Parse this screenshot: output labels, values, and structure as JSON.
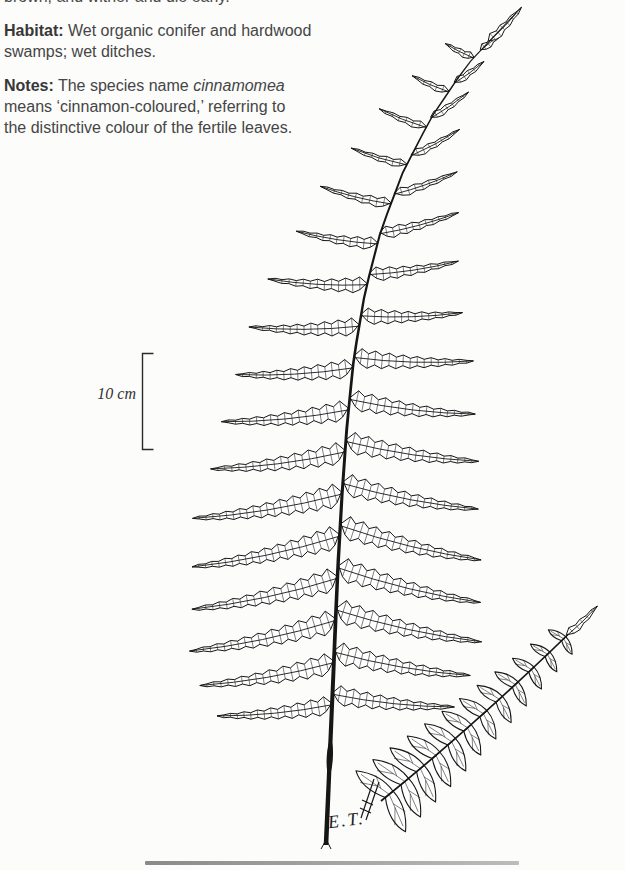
{
  "page": {
    "background": "#fcfcfb"
  },
  "top_text": {
    "clipped_line": "brown, and wither and die early.",
    "habitat": {
      "label": "Habitat:",
      "line1_rest": " Wet organic conifer and hardwood",
      "line2": "swamps; wet ditches."
    },
    "notes": {
      "label": "Notes:",
      "line1_pre": " The species name ",
      "line1_italic": "cinnamomea",
      "line2": "means ‘cinnamon-coloured,’ referring to",
      "line3": "the distinctive colour of the fertile leaves."
    }
  },
  "illustration": {
    "scale_label": "10 cm",
    "signature": "E.T.",
    "ink_color": "#161616"
  },
  "footer": {
    "bar_color_left": "#8a8a8a",
    "bar_color_right": "#bcbcbc"
  }
}
